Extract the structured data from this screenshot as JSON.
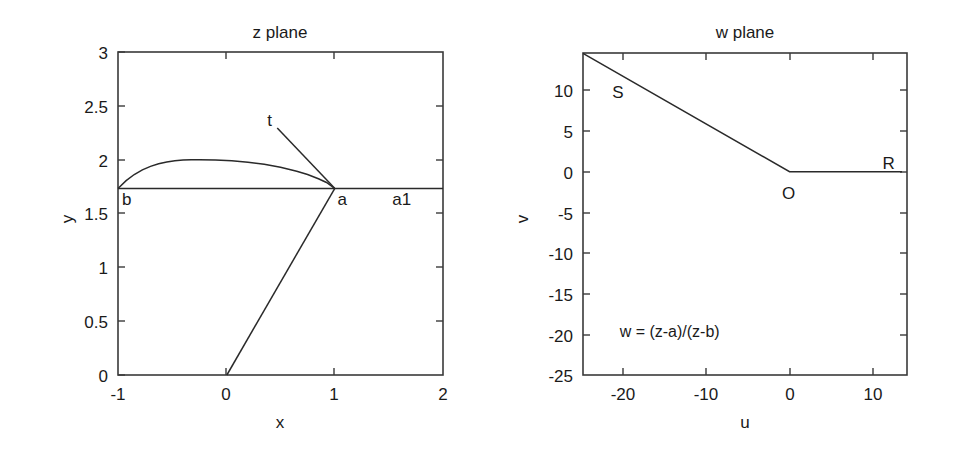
{
  "figure": {
    "width": 953,
    "height": 456,
    "background": "#ffffff",
    "ink_color": "#1a1a1a"
  },
  "chart_data": [
    {
      "type": "line",
      "title": "z plane",
      "xlabel": "x",
      "ylabel": "y",
      "xlim": [
        -1,
        2
      ],
      "ylim": [
        0,
        3
      ],
      "xticks": [
        -1,
        0,
        1,
        2
      ],
      "xticklabels": [
        "-1",
        "0",
        "1",
        "2"
      ],
      "yticks": [
        0,
        0.5,
        1,
        1.5,
        2,
        2.5,
        3
      ],
      "yticklabels": [
        "0",
        "0.5",
        "1",
        "1.5",
        "2",
        "2.5",
        "3"
      ],
      "grid": false,
      "legend": "none",
      "annotations": [
        {
          "text": "b",
          "x": -0.92,
          "y": 1.58
        },
        {
          "text": "a",
          "x": 1.07,
          "y": 1.58
        },
        {
          "text": "a1",
          "x": 1.62,
          "y": 1.58
        },
        {
          "text": "t",
          "x": 0.4,
          "y": 2.31
        }
      ],
      "series": [
        {
          "name": "baseline b-a-a1",
          "points": [
            [
              -1,
              1.732
            ],
            [
              2,
              1.732
            ]
          ]
        },
        {
          "name": "arc from b to a",
          "points": [
            [
              -1.0,
              1.732
            ],
            [
              -0.925,
              1.805
            ],
            [
              -0.85,
              1.862
            ],
            [
              -0.775,
              1.905
            ],
            [
              -0.7,
              1.938
            ],
            [
              -0.625,
              1.962
            ],
            [
              -0.55,
              1.979
            ],
            [
              -0.475,
              1.991
            ],
            [
              -0.4,
              1.997
            ],
            [
              -0.325,
              2.0
            ],
            [
              -0.25,
              2.0
            ],
            [
              -0.1,
              1.997
            ],
            [
              0.05,
              1.99
            ],
            [
              0.2,
              1.977
            ],
            [
              0.35,
              1.957
            ],
            [
              0.5,
              1.93
            ],
            [
              0.65,
              1.893
            ],
            [
              0.75,
              1.862
            ],
            [
              0.85,
              1.823
            ],
            [
              0.925,
              1.788
            ],
            [
              1.0,
              1.732
            ]
          ]
        },
        {
          "name": "tangent ray t to a",
          "points": [
            [
              0.47,
              2.295
            ],
            [
              1.0,
              1.735
            ]
          ]
        },
        {
          "name": "ray from origin to a",
          "points": [
            [
              0.005,
              0.0
            ],
            [
              1.0,
              1.732
            ]
          ]
        }
      ]
    },
    {
      "type": "line",
      "title": "w plane",
      "xlabel": "u",
      "ylabel": "v",
      "xlim": [
        -24.8,
        14.1
      ],
      "ylim": [
        -25,
        14.6
      ],
      "xticks": [
        -20,
        -10,
        0,
        10
      ],
      "xticklabels": [
        "-20",
        "-10",
        "0",
        "10"
      ],
      "yticks": [
        -25,
        -20,
        -15,
        -10,
        -5,
        0,
        5,
        10
      ],
      "yticklabels": [
        "-25",
        "-20",
        "-15",
        "-10",
        "-5",
        "0",
        "5",
        "10"
      ],
      "grid": false,
      "legend": "none",
      "annotations": [
        {
          "text": "S",
          "x": -20.6,
          "y": 9.1
        },
        {
          "text": "O",
          "x": -0.1,
          "y": -3.4
        },
        {
          "text": "R",
          "x": 11.9,
          "y": 0.3
        },
        {
          "text": "w = (z-a)/(z-b)",
          "x": -20.4,
          "y": -20.3
        }
      ],
      "series": [
        {
          "name": "image contour S-O-R",
          "points": [
            [
              -24.8,
              14.55
            ],
            [
              0.0,
              0.0
            ],
            [
              13.5,
              0.0
            ]
          ]
        }
      ]
    }
  ],
  "annotations_text": {
    "transform_formula": "w = (z−a)/(z−b)"
  }
}
